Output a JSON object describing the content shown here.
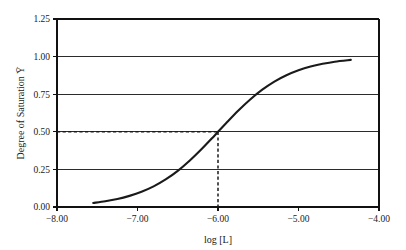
{
  "chart_data": {
    "type": "line",
    "title": "",
    "xlabel": "log [L]",
    "ylabel": "Degree of Saturation Ȳ",
    "xlim": [
      -8.0,
      -4.0
    ],
    "ylim": [
      0.0,
      1.25
    ],
    "grid": true,
    "grid_axis": "y",
    "legend": "none",
    "xticks": [
      "−8.00",
      "−7.00",
      "−6.00",
      "−5.00",
      "−4.00"
    ],
    "xtick_values": [
      -8.0,
      -7.0,
      -6.0,
      -5.0,
      -4.0
    ],
    "yticks": [
      "0.00",
      "0.25",
      "0.50",
      "0.75",
      "1.00",
      "1.25"
    ],
    "ytick_values": [
      0.0,
      0.25,
      0.5,
      0.75,
      1.0,
      1.25
    ],
    "series": [
      {
        "name": "saturation curve",
        "color": "#1a1a1a",
        "x": [
          -7.55,
          -7.4,
          -7.25,
          -7.1,
          -6.95,
          -6.8,
          -6.65,
          -6.5,
          -6.35,
          -6.2,
          -6.05,
          -6.0,
          -5.9,
          -5.75,
          -5.6,
          -5.45,
          -5.3,
          -5.15,
          -5.0,
          -4.85,
          -4.7,
          -4.55,
          -4.35
        ],
        "y": [
          0.027,
          0.038,
          0.053,
          0.074,
          0.101,
          0.137,
          0.183,
          0.24,
          0.309,
          0.387,
          0.471,
          0.5,
          0.557,
          0.64,
          0.715,
          0.78,
          0.834,
          0.876,
          0.909,
          0.934,
          0.952,
          0.966,
          0.978
        ]
      }
    ],
    "annotations": [
      {
        "name": "half-saturation-marker",
        "style": "dashed",
        "color": "#1a1a1a",
        "horizontal_from": [
          -8.0,
          0.5
        ],
        "horizontal_to": [
          -6.0,
          0.5
        ],
        "vertical_from": [
          -6.0,
          0.5
        ],
        "vertical_to": [
          -6.0,
          0.0
        ],
        "x_value": -6.0,
        "y_value": 0.5
      }
    ]
  }
}
